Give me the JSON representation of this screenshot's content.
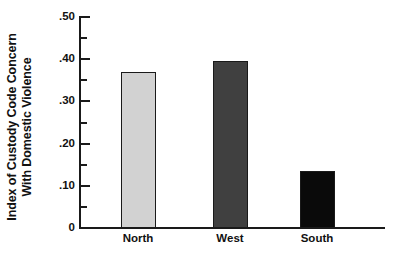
{
  "chart_data": {
    "type": "bar",
    "title": "",
    "subtitle": "",
    "xlabel": "",
    "ylabel_lines": [
      "Index of Custody Code Concern",
      "With Domestic Violence"
    ],
    "ylabel": "Index of Custody Code Concern With Domestic Violence",
    "categories": [
      "North",
      "West",
      "South"
    ],
    "values": [
      0.37,
      0.395,
      0.135
    ],
    "bar_colors": [
      "#d2d2d2",
      "#404040",
      "#0a0a0a"
    ],
    "bar_edge_color": "#1a1a1a",
    "ylim": [
      0,
      0.5
    ],
    "y_major_ticks": [
      0.5,
      0.4,
      0.3,
      0.2,
      0.1,
      0
    ],
    "y_major_tick_labels": [
      ".50",
      ".40",
      ".30",
      ".20",
      ".10",
      "0"
    ],
    "y_minor_ticks": [
      0.45,
      0.35,
      0.25,
      0.15,
      0.05
    ],
    "grid": false,
    "legend": false,
    "legend_position": "none",
    "axis_color": "#1a1a1a",
    "background_color": "#ffffff"
  }
}
